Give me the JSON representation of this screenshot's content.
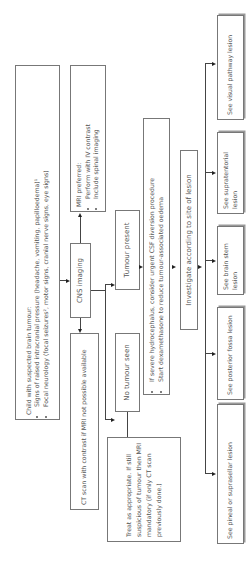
{
  "diagram": {
    "orientation": "rotated -90 degrees (reads bottom to top)",
    "presentation": {
      "title": "Child with suspected brain tumour:",
      "bullets": [
        "Signs of raised intracranial pressure (headache, vomiting, papilloedema)¹",
        "Focal neurology (focal seizures², motor signs, cranial nerve signs, eye signs)"
      ]
    },
    "cns_imaging": "CNS imaging",
    "mri": {
      "title": "MRI preferred:",
      "bullets": [
        "Perform with IV contrast",
        "Include spinal imaging"
      ]
    },
    "ct": "CT scan with contrast if MRI not possible available",
    "tumour_present": "Tumour present",
    "no_tumour": "No tumour seen",
    "management": {
      "bullets": [
        "If severe hydrocephalus, consider urgent CSF diversion procedure",
        "Start dexamethasone to reduce tumour-associated oedema"
      ]
    },
    "treat": "Treat as appropriate. If still suspicious of tumour then MRI mandatory (if only CT scan previously done.)",
    "investigate": "Investigate according to site of lesion",
    "lesions": [
      "See pineal or suprasellar lesion",
      "See posterior fossa lesion",
      "See brain stem lesion",
      "See supratentorial lesion",
      "See visual pathway lesion"
    ]
  }
}
